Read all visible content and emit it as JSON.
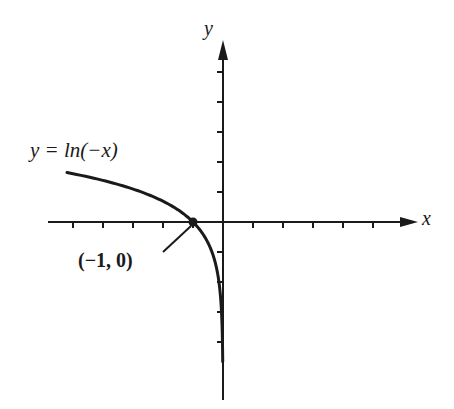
{
  "chart_data": {
    "type": "line",
    "title": "",
    "xlabel": "x",
    "ylabel": "y",
    "function": "y = ln(-x)",
    "grid": false,
    "xlim": [
      -5.8,
      6.5
    ],
    "ylim": [
      -6,
      6
    ],
    "x_ticks": [
      -5,
      -4,
      -3,
      -2,
      -1,
      1,
      2,
      3,
      4,
      5
    ],
    "y_ticks": [
      5,
      4,
      3,
      2,
      1,
      -1,
      -2,
      -3,
      -4
    ],
    "tick_labels_shown": false,
    "series": [
      {
        "name": "y = ln(-x)",
        "x": [
          -5.2,
          -5,
          -4,
          -3,
          -2,
          -1.5,
          -1,
          -0.5,
          -0.25,
          -0.1,
          -0.05,
          -0.02,
          -0.01
        ],
        "values": [
          1.649,
          1.609,
          1.386,
          1.099,
          0.693,
          0.405,
          0,
          -0.693,
          -1.386,
          -2.303,
          -2.996,
          -3.912,
          -4.605
        ]
      }
    ],
    "annotations": [
      {
        "text": "y = ln(−x)",
        "target": "curve"
      },
      {
        "text": "(−1, 0)",
        "x": -1,
        "y": 0,
        "marker": "dot"
      }
    ]
  },
  "labels": {
    "equation": "y = ln(−x)",
    "point": "(−1, 0)",
    "x_axis": "x",
    "y_axis": "y"
  },
  "colors": {
    "ink": "#1a1a1a",
    "background": "#ffffff"
  }
}
